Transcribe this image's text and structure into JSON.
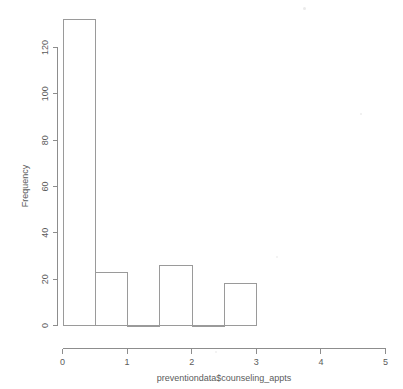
{
  "chart_data": {
    "type": "bar",
    "title": "",
    "subtitle": "",
    "xlabel": "preventiondata$counseling_appts",
    "ylabel": "Frequency",
    "bin_width": 0.5,
    "bin_edges": [
      0,
      0.5,
      1,
      1.5,
      2,
      2.5,
      3
    ],
    "categories": [
      "0-0.5",
      "0.5-1",
      "1-1.5",
      "1.5-2",
      "2-2.5",
      "2.5-3"
    ],
    "values": [
      132,
      23,
      0,
      26,
      0,
      18
    ],
    "xlim": [
      0,
      5
    ],
    "ylim": [
      0,
      132
    ],
    "xticks": [
      0,
      1,
      2,
      3,
      4,
      5
    ],
    "xticklabels": [
      "0",
      "1",
      "2",
      "3",
      "4",
      "5"
    ],
    "yticks": [
      0,
      20,
      40,
      60,
      80,
      100,
      120
    ],
    "yticklabels": [
      "0",
      "20",
      "40",
      "60",
      "80",
      "100",
      "120"
    ],
    "grid": false,
    "legend": false,
    "legend_position": "none",
    "bar_fill": "#ffffff",
    "bar_stroke": "#9a9a9a",
    "axis_color": "#8d8d8d",
    "text_color": "#5b5b5b",
    "background": "#ffffff"
  },
  "axes": {
    "y_axis_label": "Frequency",
    "x_axis_label": "preventiondata$counseling_appts",
    "y_tick_labels": [
      "0",
      "20",
      "40",
      "60",
      "80",
      "100",
      "120"
    ],
    "x_tick_labels": [
      "0",
      "1",
      "2",
      "3",
      "4",
      "5"
    ]
  }
}
